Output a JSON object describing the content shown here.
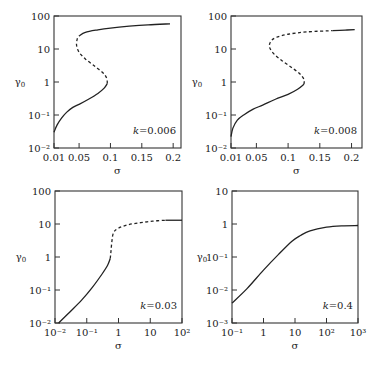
{
  "chart_data": [
    {
      "type": "line",
      "panel": "top-left",
      "annotation": "k=0.006",
      "xlabel": "σ",
      "ylabel": "γ0",
      "xscale": "linear",
      "yscale": "log",
      "xlim": [
        0.01,
        0.2125
      ],
      "ylim": [
        0.01,
        100
      ],
      "xticks": [
        0.01,
        0.05,
        0.1,
        0.15,
        0.2
      ],
      "xtick_labels": [
        "0.01",
        "0.05",
        "0.1",
        "0.15",
        "0.2"
      ],
      "yticks": [
        100,
        10,
        1,
        0.1,
        0.01
      ],
      "ytick_labels": [
        "100",
        "10",
        "1",
        "10⁻¹",
        "10⁻²"
      ],
      "frame": {
        "left": 54,
        "right": 181,
        "top": 16,
        "bottom": 148
      },
      "series": [
        {
          "name": "stable-lower",
          "style": "solid",
          "points": [
            [
              0.01,
              0.03
            ],
            [
              0.015,
              0.05
            ],
            [
              0.022,
              0.08
            ],
            [
              0.03,
              0.12
            ],
            [
              0.04,
              0.17
            ],
            [
              0.05,
              0.21
            ],
            [
              0.065,
              0.3
            ],
            [
              0.08,
              0.45
            ],
            [
              0.09,
              0.65
            ],
            [
              0.095,
              0.9
            ]
          ]
        },
        {
          "name": "unstable",
          "style": "dashed",
          "points": [
            [
              0.095,
              0.9
            ],
            [
              0.094,
              1.3
            ],
            [
              0.088,
              1.9
            ],
            [
              0.075,
              3
            ],
            [
              0.06,
              5
            ],
            [
              0.05,
              8
            ],
            [
              0.046,
              13
            ],
            [
              0.047,
              20
            ],
            [
              0.05,
              25
            ]
          ]
        },
        {
          "name": "stable-upper",
          "style": "solid",
          "points": [
            [
              0.05,
              25
            ],
            [
              0.06,
              32
            ],
            [
              0.08,
              38
            ],
            [
              0.1,
              43
            ],
            [
              0.13,
              49
            ],
            [
              0.16,
              54
            ],
            [
              0.195,
              58
            ]
          ]
        }
      ]
    },
    {
      "type": "line",
      "panel": "top-right",
      "annotation": "k=0.008",
      "xlabel": "σ",
      "ylabel": "γ0",
      "xscale": "linear",
      "yscale": "log",
      "xlim": [
        0.01,
        0.2165
      ],
      "ylim": [
        0.01,
        100
      ],
      "xticks": [
        0.01,
        0.05,
        0.1,
        0.15,
        0.2
      ],
      "xtick_labels": [
        "0.01",
        "0.05",
        "0.1",
        "0.15",
        "0.2"
      ],
      "yticks": [
        100,
        10,
        1,
        0.1,
        0.01
      ],
      "ytick_labels": [
        "100",
        "10",
        "1",
        "10⁻¹",
        "10⁻²"
      ],
      "frame": {
        "left": 231,
        "right": 362,
        "top": 16,
        "bottom": 148
      },
      "series": [
        {
          "name": "stable-lower",
          "style": "solid",
          "points": [
            [
              0.01,
              0.022
            ],
            [
              0.013,
              0.04
            ],
            [
              0.02,
              0.07
            ],
            [
              0.03,
              0.1
            ],
            [
              0.045,
              0.15
            ],
            [
              0.06,
              0.2
            ],
            [
              0.08,
              0.3
            ],
            [
              0.1,
              0.42
            ],
            [
              0.115,
              0.6
            ],
            [
              0.125,
              0.85
            ]
          ]
        },
        {
          "name": "unstable",
          "style": "dashed",
          "points": [
            [
              0.125,
              0.85
            ],
            [
              0.125,
              1.2
            ],
            [
              0.118,
              1.8
            ],
            [
              0.105,
              2.8
            ],
            [
              0.09,
              4.5
            ],
            [
              0.078,
              7
            ],
            [
              0.071,
              11
            ],
            [
              0.072,
              16
            ],
            [
              0.08,
              22
            ],
            [
              0.1,
              28
            ],
            [
              0.13,
              33
            ],
            [
              0.17,
              36
            ]
          ]
        },
        {
          "name": "stable-upper",
          "style": "solid",
          "points": [
            [
              0.17,
              36
            ],
            [
              0.19,
              37.5
            ],
            [
              0.205,
              38.5
            ]
          ]
        }
      ]
    },
    {
      "type": "line",
      "panel": "bottom-left",
      "annotation": "k=0.03",
      "xlabel": "σ",
      "ylabel": "γ0",
      "xscale": "log",
      "yscale": "log",
      "xlim": [
        0.01,
        100
      ],
      "ylim": [
        0.01,
        100
      ],
      "xticks": [
        0.01,
        0.1,
        1,
        10,
        100
      ],
      "xtick_labels": [
        "10⁻²",
        "10⁻¹",
        "1",
        "10",
        "10²"
      ],
      "yticks": [
        100,
        10,
        1,
        0.1,
        0.01
      ],
      "ytick_labels": [
        "100",
        "10",
        "1",
        "10⁻¹",
        "10⁻²"
      ],
      "frame": {
        "left": 55,
        "right": 182,
        "top": 191,
        "bottom": 323
      },
      "series": [
        {
          "name": "stable-lower",
          "style": "solid",
          "points": [
            [
              0.013,
              0.01
            ],
            [
              0.03,
              0.022
            ],
            [
              0.07,
              0.05
            ],
            [
              0.15,
              0.12
            ],
            [
              0.3,
              0.3
            ],
            [
              0.45,
              0.55
            ],
            [
              0.55,
              0.9
            ]
          ]
        },
        {
          "name": "unstable",
          "style": "dashed",
          "points": [
            [
              0.55,
              0.9
            ],
            [
              0.58,
              1.5
            ],
            [
              0.62,
              3
            ],
            [
              0.7,
              5.5
            ],
            [
              1,
              7.5
            ],
            [
              2,
              9.5
            ],
            [
              5,
              11
            ],
            [
              12,
              12.2
            ],
            [
              30,
              13
            ]
          ]
        },
        {
          "name": "stable-upper",
          "style": "solid",
          "points": [
            [
              30,
              13
            ],
            [
              60,
              13
            ],
            [
              100,
              13
            ]
          ]
        }
      ]
    },
    {
      "type": "line",
      "panel": "bottom-right",
      "annotation": "k=0.4",
      "xlabel": "σ",
      "ylabel": "γ0",
      "xscale": "log",
      "yscale": "log",
      "xlim": [
        0.1,
        1000
      ],
      "ylim": [
        0.001,
        10
      ],
      "xticks": [
        0.1,
        1,
        10,
        100,
        1000
      ],
      "xtick_labels": [
        "10⁻¹",
        "1",
        "10",
        "10²",
        "10³"
      ],
      "yticks": [
        10,
        1,
        0.1,
        0.01,
        0.001
      ],
      "ytick_labels": [
        "10",
        "1",
        "10⁻¹",
        "10⁻²",
        "10⁻³"
      ],
      "frame": {
        "left": 232,
        "right": 358,
        "top": 191,
        "bottom": 323
      },
      "series": [
        {
          "name": "stable",
          "style": "solid",
          "points": [
            [
              0.1,
              0.004
            ],
            [
              0.3,
              0.011
            ],
            [
              1,
              0.04
            ],
            [
              3,
              0.12
            ],
            [
              8,
              0.3
            ],
            [
              15,
              0.45
            ],
            [
              30,
              0.62
            ],
            [
              100,
              0.8
            ],
            [
              300,
              0.88
            ],
            [
              1000,
              0.9
            ]
          ]
        }
      ]
    }
  ]
}
